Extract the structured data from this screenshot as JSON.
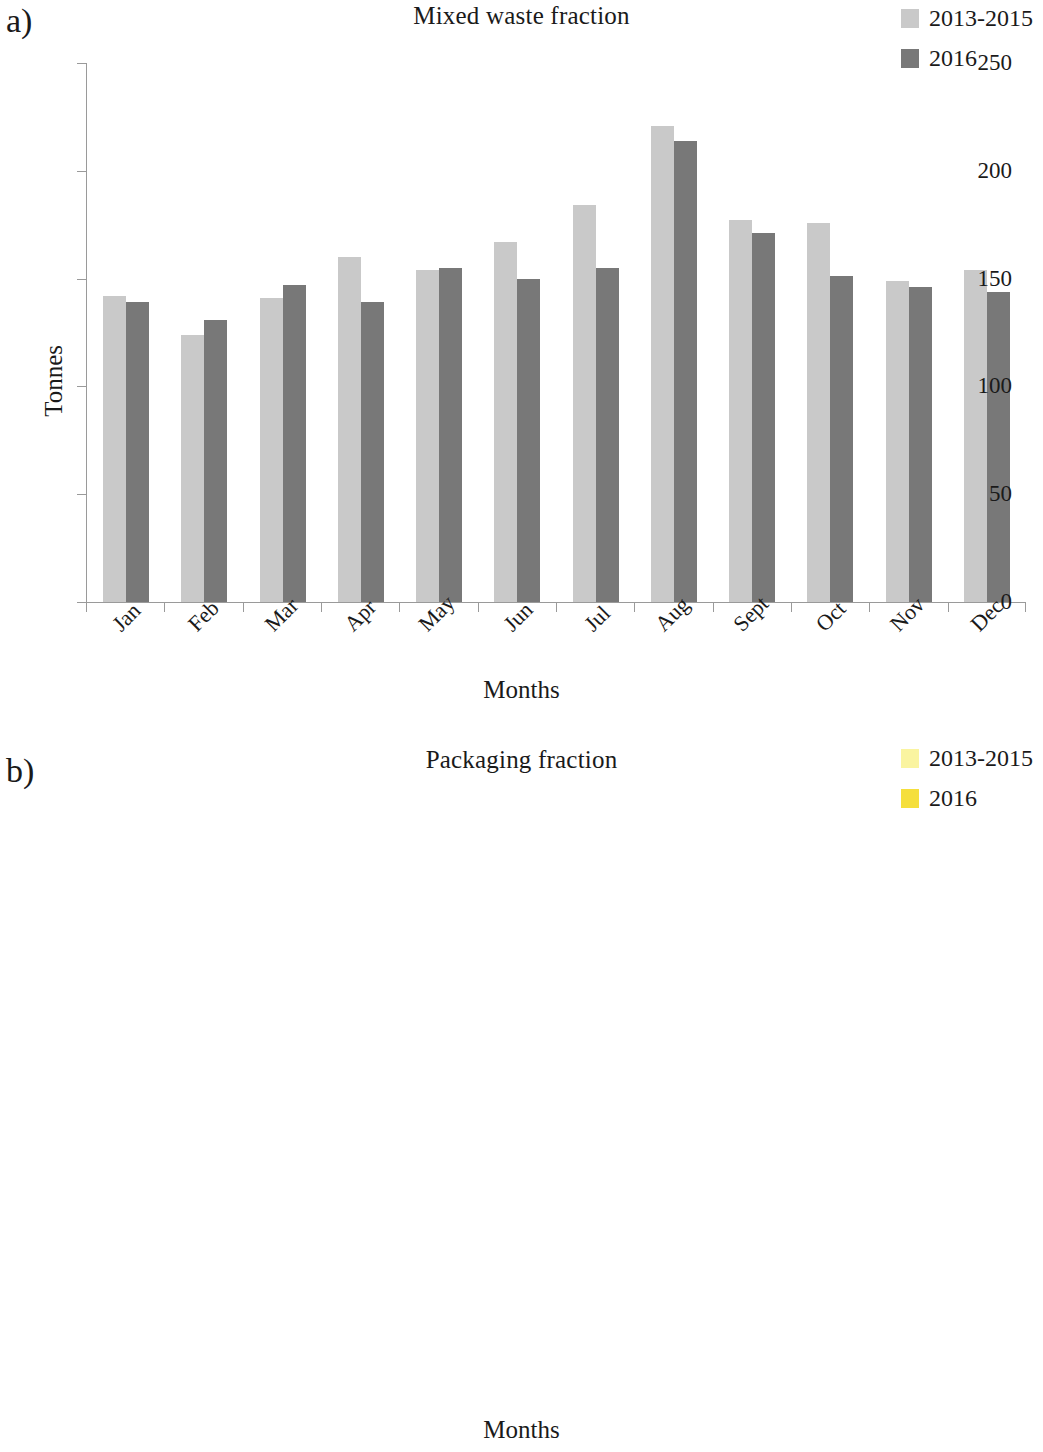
{
  "figure": {
    "panels": [
      {
        "letter": "a)"
      },
      {
        "letter": "b)"
      }
    ]
  },
  "panel_a": {
    "letter": "a)",
    "title": "Mixed waste fraction",
    "ylabel": "Tonnes",
    "xlabel": "Months",
    "legend": [
      {
        "label": "2013-2015",
        "color": "#c9c9c9"
      },
      {
        "label": "2016",
        "color": "#787878"
      }
    ]
  },
  "panel_b": {
    "letter": "b)",
    "title": "Packaging fraction",
    "ylabel": "Tonnes",
    "xlabel": "Months",
    "legend": [
      {
        "label": "2013-2015",
        "color": "#faf4a0"
      },
      {
        "label": "2016",
        "color": "#f5df3c"
      }
    ]
  },
  "chart_data": [
    {
      "type": "bar",
      "panel": "a",
      "title": "Mixed waste fraction",
      "xlabel": "Months",
      "ylabel": "Tonnes",
      "ylim": [
        0,
        250
      ],
      "yticks": [
        0,
        50,
        100,
        150,
        200,
        250
      ],
      "grid": false,
      "legend_position": "top-right",
      "categories": [
        "Jan",
        "Feb",
        "Mar",
        "Apr",
        "May",
        "Jun",
        "Jul",
        "Aug",
        "Sept",
        "Oct",
        "Nov",
        "Dec"
      ],
      "series": [
        {
          "name": "2013-2015",
          "color": "#c9c9c9",
          "values": [
            142,
            124,
            141,
            160,
            154,
            167,
            184,
            221,
            177,
            176,
            149,
            154
          ]
        },
        {
          "name": "2016",
          "color": "#787878",
          "values": [
            139,
            131,
            147,
            139,
            155,
            150,
            155,
            214,
            171,
            151,
            146,
            144
          ]
        }
      ]
    },
    {
      "type": "bar",
      "panel": "b",
      "title": "Packaging fraction",
      "xlabel": "Months",
      "ylabel": "Tonnes",
      "ylim": [
        0,
        14
      ],
      "yticks": [
        0,
        2,
        4,
        6,
        8,
        10,
        12,
        14
      ],
      "grid": false,
      "legend_position": "top-right",
      "categories": [
        "Jan",
        "Feb",
        "Mar",
        "Apr",
        "May",
        "Jun",
        "Jul",
        "Aug",
        "Sept",
        "Oct",
        "Nov",
        "Dec"
      ],
      "series": [
        {
          "name": "2013-2015",
          "color": "#faf4a0",
          "values": [
            6.5,
            6.25,
            6.5,
            7.85,
            7.05,
            7.35,
            9.75,
            8.7,
            8.4,
            8.3,
            6.4,
            8.25
          ]
        },
        {
          "name": "2016",
          "color": "#f5df3c",
          "values": [
            7.35,
            7.35,
            9.2,
            6.55,
            10.3,
            10.3,
            9.75,
            13.2,
            9.6,
            7.9,
            9.85,
            8.3
          ]
        }
      ]
    }
  ]
}
